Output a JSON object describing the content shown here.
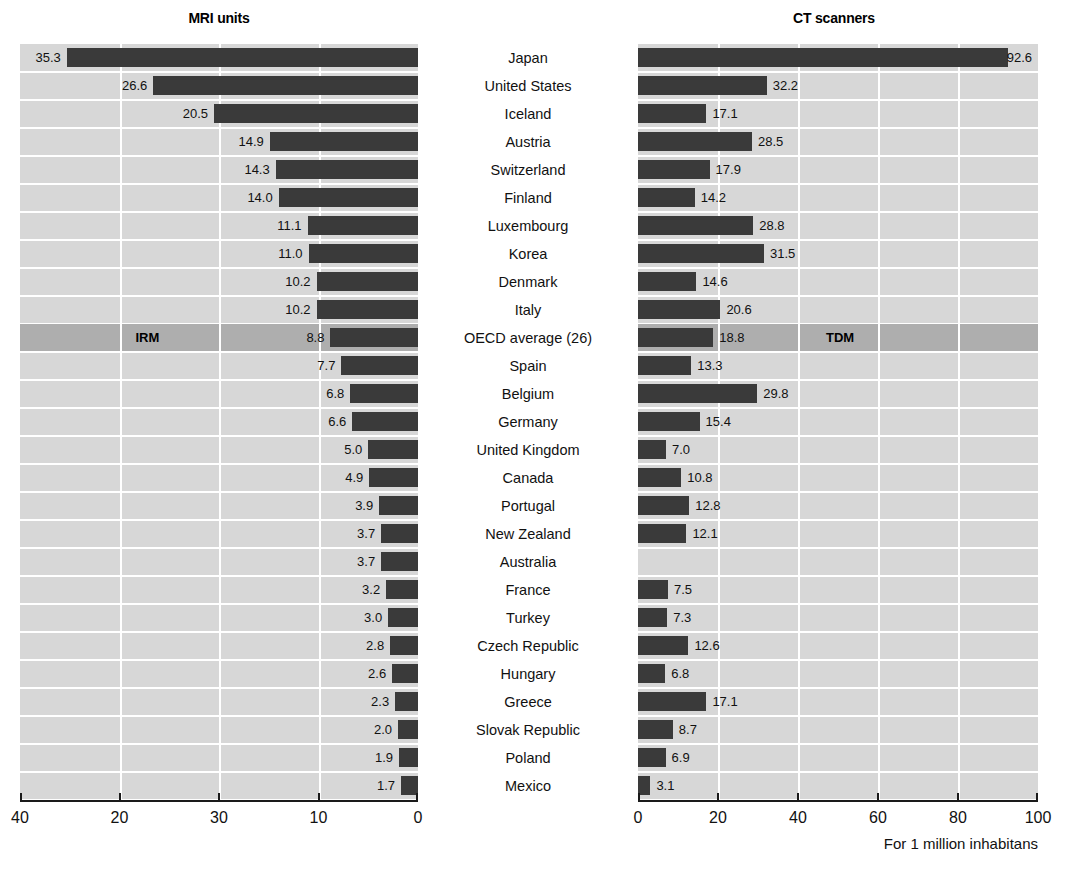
{
  "chart_data": {
    "type": "bar",
    "orientation": "horizontal",
    "layout": "back-to-back paired panels sharing a central category axis",
    "grid": true,
    "legend_position": "inline row annotation on OECD average row",
    "categories": [
      "Japan",
      "United States",
      "Iceland",
      "Austria",
      "Switzerland",
      "Finland",
      "Luxembourg",
      "Korea",
      "Denmark",
      "Italy",
      "OECD average (26)",
      "Spain",
      "Belgium",
      "Germany",
      "United Kingdom",
      "Canada",
      "Portugal",
      "New Zealand",
      "Australia",
      "France",
      "Turkey",
      "Czech Republic",
      "Hungary",
      "Greece",
      "Slovak Republic",
      "Poland",
      "Mexico"
    ],
    "series": [
      {
        "name": "MRI units",
        "tag": "IRM",
        "panel": "left",
        "direction": "right-to-left",
        "axis_label": "",
        "xlim": [
          0,
          40
        ],
        "ticks": [
          40,
          20,
          30,
          10,
          0
        ],
        "values": [
          35.3,
          26.6,
          20.5,
          14.9,
          14.3,
          14.0,
          11.1,
          11.0,
          10.2,
          10.2,
          8.8,
          7.7,
          6.8,
          6.6,
          5.0,
          4.9,
          3.9,
          3.7,
          3.7,
          3.2,
          3.0,
          2.8,
          2.6,
          2.3,
          2.0,
          1.9,
          1.7
        ]
      },
      {
        "name": "CT scanners",
        "tag": "TDM",
        "panel": "right",
        "direction": "left-to-right",
        "axis_label": "For 1 million inhabitans",
        "xlim": [
          0,
          100
        ],
        "ticks": [
          0,
          20,
          40,
          60,
          80,
          100
        ],
        "values": [
          92.6,
          32.2,
          17.1,
          28.5,
          17.9,
          14.2,
          28.8,
          31.5,
          14.6,
          20.6,
          18.8,
          13.3,
          29.8,
          15.4,
          7.0,
          10.8,
          12.8,
          12.1,
          null,
          7.5,
          7.3,
          12.6,
          6.8,
          17.1,
          8.7,
          6.9,
          3.1
        ]
      }
    ],
    "highlight_row_index": 10,
    "missing_data": [
      "Australia CT scanners"
    ]
  },
  "left_panel": {
    "title": "MRI units",
    "series_tag": "IRM",
    "tick_labels": [
      "40",
      "20",
      "30",
      "10",
      "0"
    ],
    "value_labels": [
      "35.3",
      "26.6",
      "20.5",
      "14.9",
      "14.3",
      "14.0",
      "11.1",
      "11.0",
      "10.2",
      "10.2",
      "8.8",
      "7.7",
      "6.8",
      "6.6",
      "5.0",
      "4.9",
      "3.9",
      "3.7",
      "3.7",
      "3.2",
      "3.0",
      "2.8",
      "2.6",
      "2.3",
      "2.0",
      "1.9",
      "1.7"
    ]
  },
  "right_panel": {
    "title": "CT scanners",
    "series_tag": "TDM",
    "tick_labels": [
      "0",
      "20",
      "40",
      "60",
      "80",
      "100"
    ],
    "unit_label": "For 1 million inhabitans",
    "value_labels": [
      "92.6",
      "32.2",
      "17.1",
      "28.5",
      "17.9",
      "14.2",
      "28.8",
      "31.5",
      "14.6",
      "20.6",
      "18.8",
      "13.3",
      "29.8",
      "15.4",
      "7.0",
      "10.8",
      "12.8",
      "12.1",
      "",
      "7.5",
      "7.3",
      "12.6",
      "6.8",
      "17.1",
      "8.7",
      "6.9",
      "3.1"
    ]
  },
  "categories": [
    "Japan",
    "United States",
    "Iceland",
    "Austria",
    "Switzerland",
    "Finland",
    "Luxembourg",
    "Korea",
    "Denmark",
    "Italy",
    "OECD average (26)",
    "Spain",
    "Belgium",
    "Germany",
    "United Kingdom",
    "Canada",
    "Portugal",
    "New Zealand",
    "Australia",
    "France",
    "Turkey",
    "Czech Republic",
    "Hungary",
    "Greece",
    "Slovak Republic",
    "Poland",
    "Mexico"
  ],
  "colors": {
    "bar": "#3a3a3a",
    "panel_background": "#d7d7d7",
    "highlight_row": "#aeaeae",
    "gridline": "#ffffff",
    "axis": "#1a1a1a",
    "text": "#111111"
  }
}
